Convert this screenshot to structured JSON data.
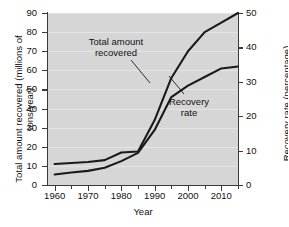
{
  "chart_data": {
    "type": "line",
    "title": "",
    "xlabel": "Year",
    "ylabel": "Total amount recovered (millions of tons/year)",
    "y2label": "Recovery rate (percentage)",
    "xlim": [
      1958,
      2015
    ],
    "ylim": [
      0,
      90
    ],
    "y2lim": [
      0,
      50
    ],
    "grid": true,
    "legend": "annotations-inline",
    "background_color": "#d6d6d6",
    "line_color": "#1a1a1a",
    "x_ticks_major": [
      1960,
      1970,
      1980,
      1990,
      2000,
      2010
    ],
    "x_ticks_minor": [
      1965,
      1975,
      1985,
      1995,
      2005,
      2015
    ],
    "y_ticks_left": [
      0,
      10,
      20,
      30,
      40,
      50,
      60,
      70,
      80,
      90
    ],
    "y_ticks_right": [
      0,
      10,
      20,
      30,
      40,
      50
    ],
    "series": [
      {
        "name": "Total amount recovered",
        "axis": "left",
        "units": "millions of tons/year",
        "x": [
          1960,
          1965,
          1970,
          1975,
          1980,
          1985,
          1990,
          1995,
          2000,
          2005,
          2010,
          2015
        ],
        "values": [
          11,
          11.5,
          12,
          13,
          17,
          17.5,
          34,
          56,
          70,
          80,
          85,
          90
        ]
      },
      {
        "name": "Recovery rate",
        "axis": "right",
        "units": "percentage",
        "x": [
          1960,
          1965,
          1970,
          1975,
          1980,
          1985,
          1990,
          1995,
          2000,
          2005,
          2010,
          2015
        ],
        "values": [
          3.1,
          3.6,
          4.1,
          5.0,
          6.9,
          9.3,
          16.0,
          25.5,
          28.8,
          31.3,
          33.9,
          34.4
        ],
        "values_on_left_scale": [
          5.5,
          6.5,
          7.4,
          9.0,
          12.5,
          16.8,
          28.8,
          46.0,
          52.0,
          56.5,
          61.0,
          62.0
        ]
      }
    ],
    "annotations": [
      {
        "id": "annot-total",
        "text_line1": "Total amount",
        "text_line2": "recovered",
        "points_to_series": "Total amount recovered"
      },
      {
        "id": "annot-rate",
        "text_line1": "Recovery",
        "text_line2": "rate",
        "points_to_series": "Recovery rate"
      }
    ]
  },
  "axes": {
    "left": {
      "title": "Total amount recovered (millions of tons/year)"
    },
    "right": {
      "title": "Recovery rate (percentage)"
    },
    "bottom": {
      "title": "Year"
    }
  },
  "tick_labels": {
    "left": [
      "90",
      "80",
      "70",
      "60",
      "50",
      "40",
      "30",
      "20",
      "10",
      "0"
    ],
    "right": [
      "50",
      "40",
      "30",
      "20",
      "10",
      "0"
    ],
    "bottom": [
      "1960",
      "1970",
      "1980",
      "1990",
      "2000",
      "2010"
    ]
  },
  "annotations": {
    "total": {
      "line1": "Total amount",
      "line2": "recovered"
    },
    "rate": {
      "line1": "Recovery",
      "line2": "rate"
    }
  }
}
